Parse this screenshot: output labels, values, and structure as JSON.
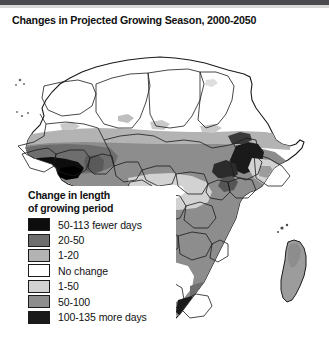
{
  "figure": {
    "title": "Changes in Projected Growing Season, 2000-2050"
  },
  "legend": {
    "title": "Change in length\nof growing period",
    "items": [
      {
        "label": "50-113 fewer days",
        "color": "#0d0d0d"
      },
      {
        "label": "20-50",
        "color": "#6e6e6e"
      },
      {
        "label": "1-20",
        "color": "#b3b3b3"
      },
      {
        "label": "No change",
        "color": "#ffffff"
      },
      {
        "label": "1-50",
        "color": "#d2d2d2"
      },
      {
        "label": "50-100",
        "color": "#8d8d8d"
      },
      {
        "label": "100-135 more days",
        "color": "#1a1a1a"
      }
    ]
  },
  "map": {
    "region": "Africa",
    "border_color": "#1a1a1a",
    "ocean_color": "#ffffff",
    "areas": [
      {
        "name": "sahara-no-change",
        "shade": "#ffffff",
        "legend_class": "No change"
      },
      {
        "name": "sahel-belt",
        "shade": "#b3b3b3",
        "legend_class": "1-20"
      },
      {
        "name": "west-africa-guinea-coast",
        "shade": "#0d0d0d",
        "legend_class": "50-113 fewer days"
      },
      {
        "name": "central-africa",
        "shade": "#8d8d8d",
        "legend_class": "50-100"
      },
      {
        "name": "congo-basin",
        "shade": "#d2d2d2",
        "legend_class": "1-50"
      },
      {
        "name": "ethiopian-highlands",
        "shade": "#1a1a1a",
        "legend_class": "100-135 more days"
      },
      {
        "name": "east-africa",
        "shade": "#8d8d8d",
        "legend_class": "50-100"
      },
      {
        "name": "southern-africa",
        "shade": "#8d8d8d",
        "legend_class": "50-100"
      },
      {
        "name": "kalahari-no-change",
        "shade": "#ffffff",
        "legend_class": "No change"
      },
      {
        "name": "south-africa-drakensberg",
        "shade": "#1a1a1a",
        "legend_class": "100-135 more days"
      },
      {
        "name": "madagascar",
        "shade": "#9c9c9c",
        "legend_class": "50-100"
      }
    ]
  }
}
